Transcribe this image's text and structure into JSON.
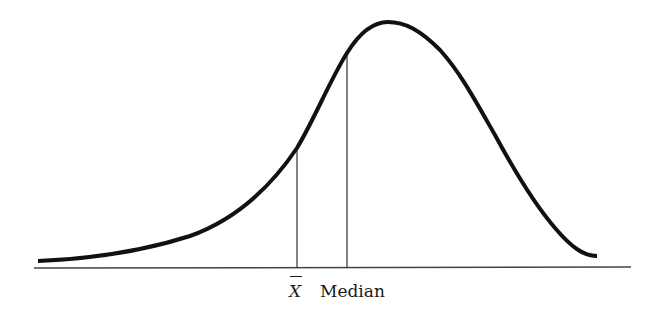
{
  "diagram": {
    "title": "",
    "type": "negatively skewed distribution curve",
    "labels": {
      "mean": "X",
      "mean_notation": "X-bar (sample mean)",
      "median": "Median"
    },
    "colors": {
      "curve": "#111111",
      "baseline": "#444444",
      "markers": "#333333",
      "background": "#ffffff"
    },
    "markers": [
      {
        "name": "mean",
        "x": 297,
        "top_y": 148
      },
      {
        "name": "median",
        "x": 347,
        "top_y": 53
      }
    ],
    "peak": {
      "x": 388,
      "y": 22
    },
    "skew": "left (negative): mean < median < mode"
  }
}
